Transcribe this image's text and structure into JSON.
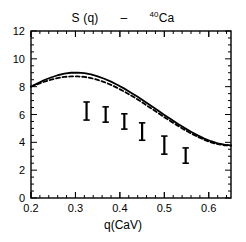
{
  "figure": {
    "title_parts": [
      {
        "text": "S (q)",
        "sup": ""
      },
      {
        "text": "–",
        "sup": ""
      },
      {
        "text": "Ca",
        "sup": "40"
      }
    ],
    "title_plain": "S (q)  –  40Ca"
  },
  "chart_data": {
    "type": "line",
    "xlabel": "q(CaV)",
    "ylabel": "",
    "xlim": [
      0.2,
      0.65
    ],
    "ylim": [
      0,
      12
    ],
    "grid": false,
    "legend": "none",
    "xticks_major": [
      0.2,
      0.3,
      0.4,
      0.5,
      0.6
    ],
    "xticklabels": [
      "0.2",
      "0.3",
      "0.4",
      "0.5",
      "0.6"
    ],
    "xticks_minor_step": 0.02,
    "yticks_major": [
      0,
      2,
      4,
      6,
      8,
      10,
      12
    ],
    "yticklabels": [
      "0",
      "2",
      "4",
      "6",
      "8",
      "10",
      "12"
    ],
    "yticks_minor_step": 0.5,
    "series": [
      {
        "name": "solid-curve",
        "style": "solid",
        "color": "#000000",
        "x": [
          0.2,
          0.215,
          0.23,
          0.245,
          0.26,
          0.275,
          0.29,
          0.305,
          0.32,
          0.335,
          0.35,
          0.365,
          0.38,
          0.395,
          0.41,
          0.425,
          0.44,
          0.455,
          0.47,
          0.485,
          0.5,
          0.515,
          0.53,
          0.545,
          0.56,
          0.575,
          0.59,
          0.605,
          0.62,
          0.635,
          0.65
        ],
        "y": [
          8.0,
          8.25,
          8.48,
          8.66,
          8.82,
          8.93,
          9.0,
          9.01,
          8.97,
          8.88,
          8.74,
          8.57,
          8.36,
          8.12,
          7.86,
          7.57,
          7.27,
          6.95,
          6.63,
          6.3,
          5.97,
          5.65,
          5.34,
          5.04,
          4.76,
          4.5,
          4.27,
          4.08,
          3.93,
          3.83,
          3.78
        ]
      },
      {
        "name": "dashed-curve",
        "style": "dashed",
        "color": "#000000",
        "x": [
          0.2,
          0.215,
          0.23,
          0.245,
          0.26,
          0.275,
          0.29,
          0.305,
          0.32,
          0.335,
          0.35,
          0.365,
          0.38,
          0.395,
          0.41,
          0.425,
          0.44,
          0.455,
          0.47,
          0.485,
          0.5,
          0.515,
          0.53,
          0.545,
          0.56,
          0.575,
          0.59,
          0.605,
          0.62,
          0.635,
          0.65
        ],
        "y": [
          8.0,
          8.18,
          8.36,
          8.5,
          8.62,
          8.7,
          8.74,
          8.74,
          8.7,
          8.62,
          8.49,
          8.33,
          8.13,
          7.9,
          7.65,
          7.37,
          7.08,
          6.77,
          6.45,
          6.13,
          5.81,
          5.5,
          5.2,
          4.91,
          4.64,
          4.4,
          4.18,
          4.0,
          3.87,
          3.79,
          3.76
        ]
      }
    ],
    "errorbars": {
      "name": "experimental-data",
      "style": "vertical-bar-with-caps",
      "color": "#000000",
      "points": [
        {
          "x": 0.325,
          "y": 6.25,
          "ylow": 5.6,
          "yhigh": 6.9
        },
        {
          "x": 0.368,
          "y": 6.05,
          "ylow": 5.45,
          "yhigh": 6.55
        },
        {
          "x": 0.41,
          "y": 5.5,
          "ylow": 4.95,
          "yhigh": 6.05
        },
        {
          "x": 0.45,
          "y": 4.8,
          "ylow": 4.15,
          "yhigh": 5.4
        },
        {
          "x": 0.5,
          "y": 3.8,
          "ylow": 3.15,
          "yhigh": 4.45
        },
        {
          "x": 0.548,
          "y": 3.05,
          "ylow": 2.5,
          "yhigh": 3.6
        }
      ]
    }
  }
}
